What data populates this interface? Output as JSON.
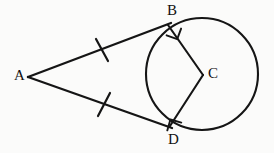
{
  "figure": {
    "canvas": {
      "width": 274,
      "height": 153
    },
    "background_color": "#fbfbfa",
    "stroke_color": "#151515"
  },
  "labels": {
    "a": "A",
    "b": "B",
    "c": "C",
    "d": "D"
  },
  "points": {
    "A": {
      "name": "external-point",
      "x": 28,
      "y": 77
    },
    "B": {
      "name": "upper-tangent-point",
      "x": 168,
      "y": 25
    },
    "C": {
      "name": "circle-center",
      "x": 203,
      "y": 75
    },
    "D": {
      "name": "lower-tangent-point",
      "x": 170,
      "y": 126
    }
  },
  "circle": {
    "cx": 202,
    "cy": 74,
    "r": 56
  },
  "segments": [
    {
      "name": "tangent-AB",
      "from": "A",
      "to": "B",
      "x1": 28,
      "y1": 77,
      "x2": 171,
      "y2": 23
    },
    {
      "name": "tangent-AD",
      "from": "A",
      "to": "D",
      "x1": 28,
      "y1": 77,
      "x2": 172,
      "y2": 128
    },
    {
      "name": "radius-CB",
      "from": "C",
      "to": "B",
      "x1": 203,
      "y1": 75,
      "x2": 168,
      "y2": 25
    },
    {
      "name": "radius-CD",
      "from": "C",
      "to": "D",
      "x1": 203,
      "y1": 75,
      "x2": 170,
      "y2": 126
    }
  ],
  "congruence_ticks": [
    {
      "name": "tick-on-AB",
      "cx": 102,
      "cy": 50
    },
    {
      "name": "tick-on-AD",
      "cx": 104,
      "cy": 104
    }
  ],
  "right_angles": [
    {
      "name": "right-angle-at-B",
      "vertex": "B"
    },
    {
      "name": "right-angle-at-D",
      "vertex": "D"
    }
  ]
}
